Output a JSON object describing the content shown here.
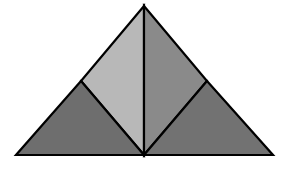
{
  "diagram": {
    "type": "triangle-dissection",
    "background": "#ffffff",
    "stroke_color": "#000000",
    "stroke_width": 2.2,
    "vertices": {
      "apex": [
        144,
        6
      ],
      "bottom_left": [
        16,
        155
      ],
      "bottom_right": [
        273,
        155
      ],
      "bottom_mid": [
        144,
        155
      ],
      "left_mid": [
        81,
        81
      ],
      "right_mid": [
        207,
        81
      ]
    },
    "pieces": [
      {
        "name": "upper-left-triangle",
        "points": "144,6 81,81 144,155",
        "fill": "#b8b8b8"
      },
      {
        "name": "upper-right-triangle",
        "points": "144,6 207,81 144,155",
        "fill": "#8a8a8a"
      },
      {
        "name": "lower-left-triangle",
        "points": "81,81 16,155 144,155",
        "fill": "#6e6e6e"
      },
      {
        "name": "lower-right-triangle",
        "points": "207,81 273,155 144,155",
        "fill": "#727272"
      }
    ]
  }
}
